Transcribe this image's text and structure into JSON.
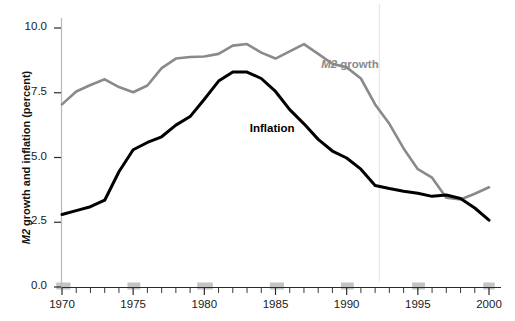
{
  "chart_data": {
    "type": "line",
    "title": "",
    "xlabel": "",
    "ylabel": "M2 growth and inflation (percent)",
    "ylabel_italic_prefix": "M2",
    "ylabel_rest": " growth and inflation (percent)",
    "xlim": [
      1969.3,
      2000.7
    ],
    "ylim": [
      0.0,
      10.0
    ],
    "grid": false,
    "x": [
      1970,
      1971,
      1972,
      1973,
      1974,
      1975,
      1976,
      1977,
      1978,
      1979,
      1980,
      1981,
      1982,
      1983,
      1984,
      1985,
      1986,
      1987,
      1988,
      1989,
      1990,
      1991,
      1992,
      1993,
      1994,
      1995,
      1996,
      1997,
      1998,
      1999,
      2000
    ],
    "y_ticks": [
      "0.0",
      "2.5",
      "5.0",
      "7.5",
      "10.0"
    ],
    "y_tick_values": [
      0.0,
      2.5,
      5.0,
      7.5,
      10.0
    ],
    "x_ticks": [
      "1970",
      "1975",
      "1980",
      "1985",
      "1990",
      "1995",
      "2000"
    ],
    "x_tick_values": [
      1970,
      1975,
      1980,
      1985,
      1990,
      1995,
      2000
    ],
    "x_minor_ticks": [
      1971,
      1972,
      1973,
      1974,
      1976,
      1977,
      1978,
      1979,
      1981,
      1982,
      1983,
      1984,
      1986,
      1987,
      1988,
      1989,
      1991,
      1992,
      1993,
      1994,
      1996,
      1997,
      1998,
      1999
    ],
    "shaded_bands": [
      {
        "start": 1969.6,
        "end": 1970.6
      },
      {
        "start": 1974.6,
        "end": 1975.5
      },
      {
        "start": 1979.5,
        "end": 1980.6
      },
      {
        "start": 1984.6,
        "end": 1985.6
      },
      {
        "start": 1989.6,
        "end": 1990.5
      },
      {
        "start": 1994.6,
        "end": 1995.5
      },
      {
        "start": 1999.6,
        "end": 2000.4
      }
    ],
    "vertical_reference_line": 1992.3,
    "series": [
      {
        "name": "M2 growth",
        "color": "#8a8a8a",
        "label_x": 1991.3,
        "label_y": 8.55,
        "values": [
          7.05,
          7.55,
          7.8,
          8.02,
          7.72,
          7.52,
          7.78,
          8.45,
          8.82,
          8.88,
          8.9,
          9.0,
          9.32,
          9.38,
          9.05,
          8.82,
          9.1,
          9.38,
          9.0,
          8.62,
          8.48,
          8.05,
          7.05,
          6.3,
          5.35,
          4.55,
          4.22,
          3.45,
          3.38,
          3.6,
          3.85
        ]
      },
      {
        "name": "Inflation",
        "color": "#000000",
        "label_x": 1985.3,
        "label_y": 6.05,
        "values": [
          2.8,
          2.95,
          3.1,
          3.35,
          4.45,
          5.3,
          5.58,
          5.8,
          6.25,
          6.58,
          7.25,
          7.95,
          8.3,
          8.3,
          8.05,
          7.55,
          6.85,
          6.3,
          5.7,
          5.25,
          4.98,
          4.55,
          3.92,
          3.8,
          3.7,
          3.62,
          3.5,
          3.55,
          3.42,
          3.05,
          2.58
        ]
      }
    ]
  }
}
